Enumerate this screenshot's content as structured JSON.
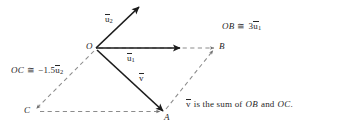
{
  "figure": {
    "colors": {
      "solid_vector": "#1c1c1c",
      "dashed_line": "#8c8c8c",
      "text": "#262626",
      "background": "#ffffff"
    },
    "points": [
      {
        "name": "O",
        "label": "O",
        "x": 96,
        "y": 48
      },
      {
        "name": "B",
        "label": "B",
        "x": 215,
        "y": 48
      },
      {
        "name": "C",
        "label": "C",
        "x": 35,
        "y": 110
      },
      {
        "name": "A",
        "label": "A",
        "x": 163,
        "y": 112
      }
    ],
    "vectors": [
      {
        "name": "u2",
        "label_prefix": "u",
        "label_sub": "2",
        "style": "solid",
        "from": "O",
        "to_x": 139,
        "to_y": 6
      },
      {
        "name": "u1",
        "label_prefix": "u",
        "label_sub": "1",
        "style": "solid",
        "from": "O",
        "to_x": 180,
        "to_y": 48
      },
      {
        "name": "v",
        "label_prefix": "v",
        "label_sub": "",
        "style": "solid",
        "from": "O",
        "to_x": 163,
        "to_y": 112
      }
    ],
    "dashed_segments": [
      {
        "name": "O-to-B",
        "from": "O",
        "to": "B",
        "arrow": true
      },
      {
        "name": "O-to-C",
        "from": "O",
        "to": "C",
        "arrow": true
      },
      {
        "name": "C-to-A",
        "from": "C",
        "to": "A",
        "arrow": true
      },
      {
        "name": "A-to-B",
        "from": "A",
        "to": "B",
        "arrow": true
      }
    ],
    "labels": {
      "point_O": "O",
      "point_A": "A",
      "point_B": "B",
      "point_C": "C",
      "vector_u2_base": "u",
      "vector_u2_sub": "2",
      "vector_u1_base": "u",
      "vector_u1_sub": "1",
      "vector_v_base": "v"
    },
    "annotations": {
      "ob_relation": {
        "name": "OB-relation",
        "lhs": "OB",
        "relation": "≅",
        "coefficient": "3",
        "vector_base": "u",
        "vector_sub": "1"
      },
      "oc_relation": {
        "name": "OC-relation",
        "lhs": "OC",
        "relation": "≅",
        "coefficient": "−1.5",
        "vector_base": "u",
        "vector_sub": "2"
      },
      "sum_caption": {
        "name": "sum-caption",
        "vector_base": "v",
        "text_mid": "is the sum of",
        "term1": "OB",
        "conjunction": "and",
        "term2": "OC",
        "period": "."
      }
    }
  }
}
